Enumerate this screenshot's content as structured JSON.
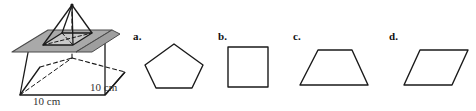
{
  "question": {
    "name": "cross-section-of-pyramid-multiple-choice",
    "figure": {
      "name": "square-pyramid-with-cutting-plane",
      "solid": "square pyramid",
      "cutting_plane": "horizontal plane parallel to base",
      "plane_fill": "#a9a9a9",
      "outline_color": "#1a1a1a",
      "hidden_edge_style": "dashed",
      "dimensions": [
        {
          "id": "base-edge",
          "value": "10 cm"
        },
        {
          "id": "right-edge",
          "value": "10 cm"
        }
      ]
    },
    "choices": [
      {
        "key": "a.",
        "shape": "pentagon",
        "name": "choice-a-pentagon"
      },
      {
        "key": "b.",
        "shape": "square",
        "name": "choice-b-square"
      },
      {
        "key": "c.",
        "shape": "trapezoid",
        "name": "choice-c-trapezoid"
      },
      {
        "key": "d.",
        "shape": "parallelogram",
        "name": "choice-d-parallelogram"
      }
    ]
  }
}
